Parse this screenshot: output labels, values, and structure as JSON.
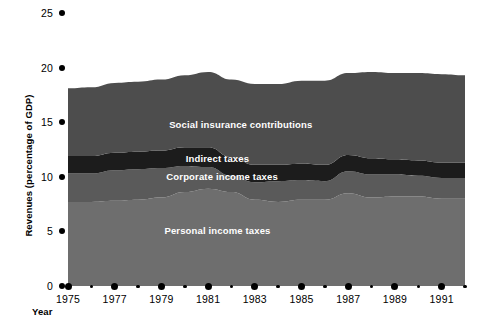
{
  "chart_data": {
    "type": "area",
    "stacked": true,
    "title": "",
    "xlabel": "Year",
    "ylabel": "Revenues (percentage of GDP)",
    "xlim": [
      1975,
      1992
    ],
    "ylim": [
      0,
      25
    ],
    "yticks": [
      0,
      5,
      10,
      15,
      20,
      25
    ],
    "xticks": [
      1975,
      1976,
      1977,
      1978,
      1979,
      1980,
      1981,
      1982,
      1983,
      1984,
      1985,
      1986,
      1987,
      1988,
      1989,
      1990,
      1991,
      1992
    ],
    "xtick_labels": [
      "1975",
      "",
      "1977",
      "",
      "1979",
      "",
      "1981",
      "",
      "1983",
      "",
      "1985",
      "",
      "1987",
      "",
      "1989",
      "",
      "1991",
      ""
    ],
    "grid": false,
    "legend_position": "inline",
    "x": [
      1975,
      1976,
      1977,
      1978,
      1979,
      1980,
      1981,
      1982,
      1983,
      1984,
      1985,
      1986,
      1987,
      1988,
      1989,
      1990,
      1991,
      1992
    ],
    "series": [
      {
        "name": "Personal income taxes",
        "color": "#6e6e6e",
        "label_x": 1981.4,
        "label_y": 5.0,
        "values": [
          7.7,
          7.7,
          7.8,
          7.9,
          8.1,
          8.6,
          8.9,
          8.6,
          7.9,
          7.7,
          7.9,
          7.9,
          8.5,
          8.1,
          8.2,
          8.2,
          8.0,
          8.0
        ]
      },
      {
        "name": "Corporate income taxes",
        "color": "#5a5a5a",
        "label_x": 1981.6,
        "label_y": 10.0,
        "values": [
          2.6,
          2.6,
          2.8,
          2.8,
          2.7,
          2.4,
          2.0,
          1.5,
          1.6,
          1.9,
          1.8,
          1.7,
          2.0,
          2.1,
          2.0,
          1.9,
          1.9,
          1.9
        ]
      },
      {
        "name": "Indirect taxes",
        "color": "#1c1c1c",
        "label_x": 1981.4,
        "label_y": 11.6,
        "values": [
          1.6,
          1.6,
          1.6,
          1.6,
          1.6,
          1.7,
          1.8,
          1.7,
          1.6,
          1.5,
          1.5,
          1.5,
          1.5,
          1.5,
          1.4,
          1.4,
          1.4,
          1.4
        ]
      },
      {
        "name": "Social insurance contributions",
        "color": "#4d4d4d",
        "label_x": 1982.4,
        "label_y": 14.7,
        "values": [
          6.2,
          6.3,
          6.4,
          6.4,
          6.5,
          6.6,
          6.9,
          7.1,
          7.4,
          7.4,
          7.6,
          7.7,
          7.5,
          7.9,
          7.9,
          8.0,
          8.1,
          8.0
        ]
      }
    ],
    "totals": [
      18.1,
      18.2,
      18.6,
      18.7,
      18.9,
      19.3,
      19.6,
      18.9,
      18.5,
      18.5,
      18.8,
      18.8,
      19.5,
      19.6,
      19.5,
      19.5,
      19.4,
      19.3
    ]
  },
  "axes": {
    "y_title": "Revenues (percentage of GDP)",
    "x_title": "Year"
  },
  "colors": {
    "background": "#ffffff",
    "axis": "#000000",
    "personal_income_taxes": "#6e6e6e",
    "corporate_income_taxes": "#5a5a5a",
    "indirect_taxes": "#1c1c1c",
    "social_insurance_contributions": "#4d4d4d",
    "label_text": "#ffffff"
  }
}
